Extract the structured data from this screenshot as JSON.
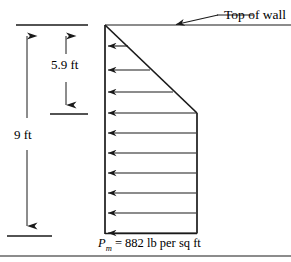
{
  "figure": {
    "title_label": "Top of wall",
    "dimensions": [
      {
        "name": "total-height",
        "value": "9 ft"
      },
      {
        "name": "upper-height",
        "value": "5.9 ft"
      }
    ],
    "pressure_label": {
      "symbol": "P",
      "subscript": "m",
      "equals": "=",
      "value": "882",
      "units": "lb per sq ft",
      "full_text": "P_m = 882 lb per sq ft"
    },
    "colors": {
      "line": "#1a1a1a",
      "text": "#000000",
      "background": "#ffffff"
    },
    "geometry": {
      "wall_left_x": 105,
      "wall_right_x": 197,
      "wall_top_y": 25,
      "wall_bottom_y": 233,
      "triangle_apex_y": 25,
      "break_y": 113,
      "arrow_count": 10
    }
  }
}
